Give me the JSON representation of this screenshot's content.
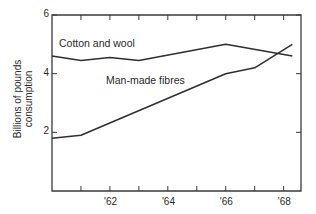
{
  "chart_data": {
    "type": "line",
    "title": "",
    "xlabel": "",
    "ylabel": "Billions of pounds consumption",
    "ylabel_lines": [
      "Billions of pounds",
      "consumption"
    ],
    "xlim": [
      1960,
      1968.6
    ],
    "ylim": [
      0,
      6
    ],
    "yticks": [
      2,
      4,
      6
    ],
    "ytick_labels": [
      "2",
      "4",
      "6"
    ],
    "xticks": [
      1961,
      1962,
      1963,
      1964,
      1965,
      1966,
      1967,
      1968
    ],
    "xtick_labels": [
      "",
      "'62",
      "",
      "'64",
      "",
      "'66",
      "",
      "'68"
    ],
    "grid": false,
    "legend": "inline labels",
    "series": [
      {
        "name": "Cotton and wool",
        "x": [
          1960,
          1961,
          1962,
          1963,
          1966,
          1968.3
        ],
        "values": [
          4.6,
          4.45,
          4.55,
          4.45,
          5.0,
          4.6
        ]
      },
      {
        "name": "Man-made fibres",
        "x": [
          1960,
          1961,
          1966,
          1967,
          1968.3
        ],
        "values": [
          1.8,
          1.9,
          4.0,
          4.2,
          5.0
        ]
      }
    ]
  }
}
